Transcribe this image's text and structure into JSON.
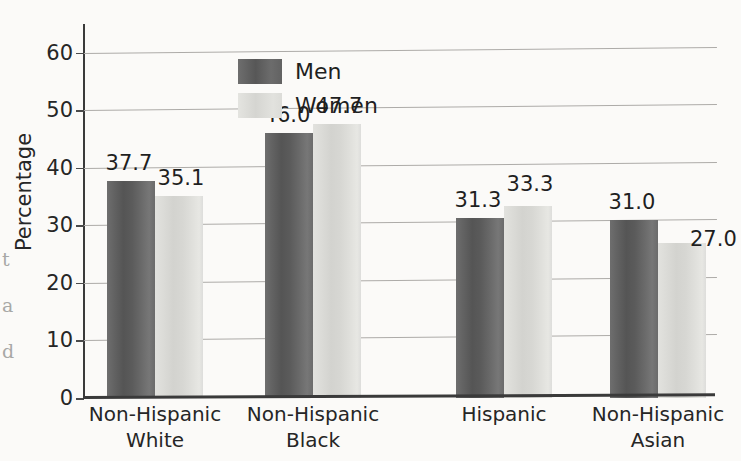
{
  "chart_data": {
    "type": "bar",
    "title": "",
    "xlabel": "",
    "ylabel": "Percentage",
    "ylim": [
      0,
      65
    ],
    "yticks": [
      0,
      10,
      20,
      30,
      40,
      50,
      60
    ],
    "ytick_labels": [
      "0",
      "10",
      "20",
      "30",
      "40",
      "50",
      "60"
    ],
    "grid": "horizontal",
    "legend_position": "top-left-inside",
    "categories": [
      "Non-Hispanic\nWhite",
      "Non-Hispanic\nBlack",
      "Hispanic",
      "Non-Hispanic\nAsian"
    ],
    "series": [
      {
        "name": "Men",
        "color": "#5d5d5d",
        "values": [
          37.7,
          46.0,
          31.3,
          31.0
        ],
        "labels": [
          "37.7",
          "46.0",
          "31.3",
          "31.0"
        ]
      },
      {
        "name": "Women",
        "color": "#dcdcd8",
        "values": [
          35.1,
          47.7,
          33.3,
          27.0
        ],
        "labels": [
          "35.1",
          "47.7",
          "33.3",
          "27.0"
        ]
      }
    ]
  },
  "legend": {
    "items": [
      {
        "label": "Men",
        "swatch": "men"
      },
      {
        "label": "Women",
        "swatch": "women"
      }
    ]
  },
  "page_bleed": {
    "text": "t\na\nd"
  },
  "colors": {
    "men_bar": "#5d5d5d",
    "women_bar": "#dcdcd8",
    "axis": "#3a3a3a",
    "gridline": "#adaba8",
    "text": "#262626",
    "background": "#fbfaf8"
  }
}
